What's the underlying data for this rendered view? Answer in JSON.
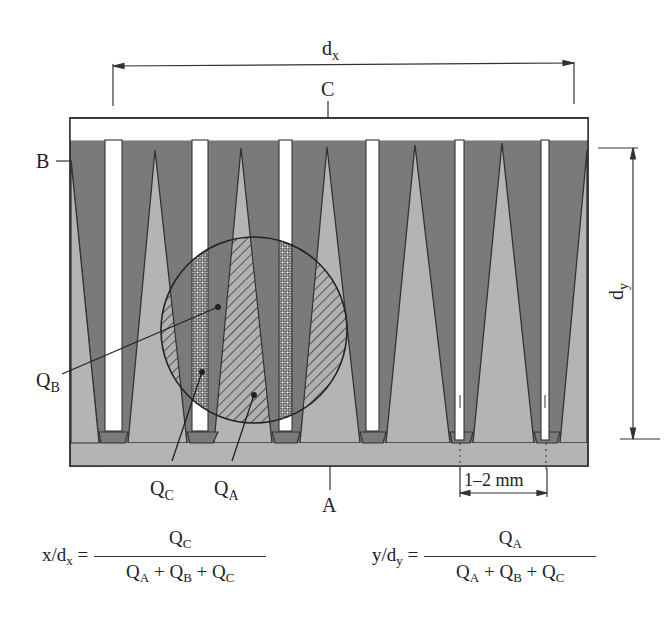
{
  "diagram": {
    "type": "interdigitated-electrode-cross-section",
    "labels": {
      "top_dimension": "d",
      "top_dimension_sub": "x",
      "side_dimension": "d",
      "side_dimension_sub": "y",
      "top_electrode": "C",
      "left_electrode": "B",
      "bottom_electrode": "A",
      "gap_dimension": "1–2 mm",
      "q_b": "Q",
      "q_b_sub": "B",
      "q_c": "Q",
      "q_c_sub": "C",
      "q_a": "Q",
      "q_a_sub": "A"
    },
    "colors": {
      "region_a_fill": "#b4b4b4",
      "region_b_fill": "#7a7a7a",
      "region_c_fill": "#ffffff",
      "outline": "#333333"
    },
    "finger_count": 7
  },
  "formulas": {
    "x": {
      "lhs_var": "x/d",
      "lhs_sub": "x",
      "eq": " =",
      "numerator": "Q",
      "numerator_sub": "C",
      "den_terms": [
        {
          "q": "Q",
          "sub": "A",
          "op": " + "
        },
        {
          "q": "Q",
          "sub": "B",
          "op": " + "
        },
        {
          "q": "Q",
          "sub": "C",
          "op": ""
        }
      ]
    },
    "y": {
      "lhs_var": "y/d",
      "lhs_sub": "y",
      "eq": " =",
      "numerator": "Q",
      "numerator_sub": "A",
      "den_terms": [
        {
          "q": "Q",
          "sub": "A",
          "op": " + "
        },
        {
          "q": "Q",
          "sub": "B",
          "op": " + "
        },
        {
          "q": "Q",
          "sub": "C",
          "op": ""
        }
      ]
    }
  }
}
